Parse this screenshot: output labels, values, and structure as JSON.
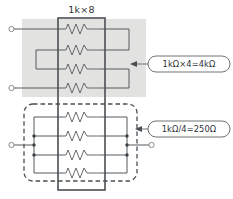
{
  "figure": {
    "title": "1k×8",
    "width": 233,
    "height": 199,
    "background": "#ffffff"
  },
  "component": {
    "label": "1k×8",
    "description": "resistor-network-ic",
    "resistor_count": 8,
    "resistance_each": "1kΩ"
  },
  "annotations": [
    {
      "id": "series-callout",
      "text": "1kΩ×4=4kΩ",
      "points_to": "series-group",
      "x": 160,
      "y": 64
    },
    {
      "id": "parallel-callout",
      "text": "1kΩ/4=250Ω",
      "points_to": "parallel-group",
      "x": 160,
      "y": 129
    }
  ],
  "groups": {
    "series": {
      "name": "series-connection-group",
      "highlight_color": "#e2e2e0",
      "resistors": 4,
      "result": "4kΩ",
      "terminals": 2
    },
    "parallel": {
      "name": "parallel-connection-group",
      "border_style": "dashed",
      "resistors": 4,
      "result": "250Ω",
      "terminals": 2
    }
  },
  "colors": {
    "wire": "#555a5e",
    "ic_outline": "#4a4f53",
    "shade": "#e2e2e0",
    "text": "#2e3235",
    "node": "#3b4044"
  }
}
